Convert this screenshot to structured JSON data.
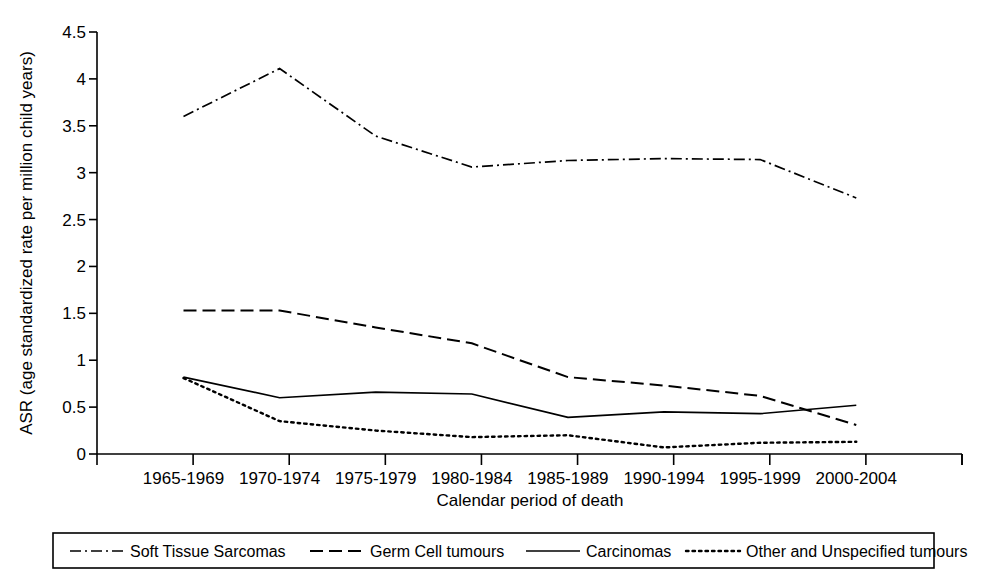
{
  "chart_data": {
    "type": "line",
    "title": "",
    "xlabel": "Calendar period of death",
    "ylabel": "ASR (age standardized rate per million child years)",
    "categories": [
      "1965-1969",
      "1970-1974",
      "1975-1979",
      "1980-1984",
      "1985-1989",
      "1990-1994",
      "1995-1999",
      "2000-2004"
    ],
    "ylim": [
      0,
      4.5
    ],
    "yticks": [
      "0",
      "0.5",
      "1",
      "1.5",
      "2",
      "2.5",
      "3",
      "3.5",
      "4",
      "4.5"
    ],
    "ytick_values": [
      0,
      0.5,
      1,
      1.5,
      2,
      2.5,
      3,
      3.5,
      4,
      4.5
    ],
    "grid": false,
    "legend_position": "bottom",
    "series": [
      {
        "name": "Soft Tissue Sarcomas",
        "style": "dash-dot",
        "color": "#000000",
        "values": [
          3.6,
          4.11,
          3.39,
          3.06,
          3.13,
          3.15,
          3.14,
          2.73
        ]
      },
      {
        "name": "Germ Cell tumours",
        "style": "dashed",
        "color": "#000000",
        "values": [
          1.53,
          1.53,
          1.35,
          1.18,
          0.82,
          0.73,
          0.62,
          0.31
        ]
      },
      {
        "name": "Carcinomas",
        "style": "solid",
        "color": "#000000",
        "values": [
          0.82,
          0.6,
          0.66,
          0.64,
          0.39,
          0.45,
          0.43,
          0.52
        ]
      },
      {
        "name": "Other and Unspecified tumours",
        "style": "dotted",
        "color": "#000000",
        "values": [
          0.81,
          0.35,
          0.25,
          0.18,
          0.2,
          0.07,
          0.12,
          0.13
        ]
      }
    ]
  },
  "axes": {
    "x_axis_title": "Calendar period of death",
    "y_axis_title": "ASR (age standardized rate per million child years)"
  }
}
